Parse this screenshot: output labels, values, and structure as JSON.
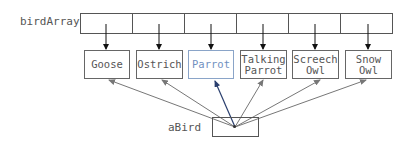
{
  "diagram": {
    "array_label": "birdArray",
    "array_cell_count": 6,
    "birds": [
      {
        "label": "Goose",
        "highlighted": false
      },
      {
        "label": "Ostrich",
        "highlighted": false
      },
      {
        "label": "Parrot",
        "highlighted": true
      },
      {
        "label": "Talking\nParrot",
        "highlighted": false
      },
      {
        "label": "Screech\nOwl",
        "highlighted": false
      },
      {
        "label": "Snow\nOwl",
        "highlighted": false
      }
    ],
    "pointer_label": "aBird",
    "colors": {
      "array_arrow": "#111111",
      "gray_arrow": "#777777",
      "highlight_arrow": "#2a3f6e",
      "highlight_text": "#6f8fbf"
    }
  }
}
